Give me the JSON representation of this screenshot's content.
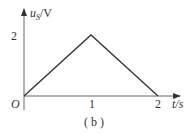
{
  "chart_data": {
    "type": "line",
    "title": "",
    "caption": "( b )",
    "xlabel": "t/s",
    "ylabel": "uS/V",
    "ylabel_main": "u",
    "ylabel_sub": "S",
    "ylabel_unit": "/V",
    "origin_label": "O",
    "x": [
      0,
      1,
      2
    ],
    "values": [
      0,
      2,
      0
    ],
    "x_ticks": [
      "1",
      "2"
    ],
    "y_ticks": [
      "2"
    ],
    "xlim": [
      0,
      2.3
    ],
    "ylim": [
      0,
      2.8
    ],
    "grid": false,
    "legend": null,
    "color": "#333333"
  }
}
